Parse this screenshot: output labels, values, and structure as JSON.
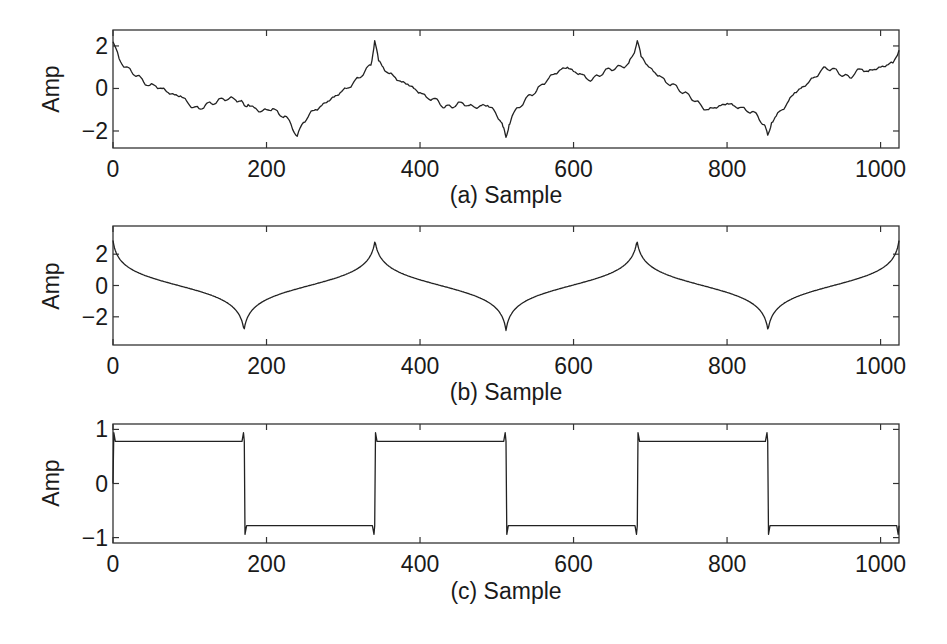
{
  "chart_data": [
    {
      "type": "line",
      "panel": "a",
      "title": "",
      "xlabel": "(a) Sample",
      "ylabel": "Amp",
      "xlim": [
        0,
        1024
      ],
      "ylim": [
        -2.8,
        2.75
      ],
      "xticks": [
        0,
        200,
        400,
        600,
        800,
        1000
      ],
      "yticks": [
        2,
        0,
        -2
      ],
      "ytick_labels": [
        "2",
        "0",
        "−2"
      ],
      "grid": false,
      "series": [
        {
          "name": "noisy signal",
          "x": [
            0,
            8,
            16,
            24,
            32,
            40,
            48,
            56,
            64,
            72,
            80,
            88,
            96,
            104,
            112,
            120,
            128,
            136,
            144,
            152,
            160,
            166,
            171,
            176,
            184,
            192,
            200,
            208,
            216,
            224,
            232,
            240,
            248,
            256,
            264,
            272,
            280,
            288,
            296,
            304,
            312,
            320,
            328,
            336,
            341,
            346,
            352,
            360,
            368,
            376,
            384,
            392,
            400,
            408,
            416,
            424,
            432,
            440,
            448,
            456,
            464,
            472,
            480,
            488,
            496,
            504,
            508,
            512,
            516,
            520,
            528,
            536,
            544,
            552,
            560,
            568,
            576,
            584,
            592,
            600,
            608,
            616,
            624,
            632,
            640,
            648,
            656,
            664,
            672,
            678,
            683,
            688,
            696,
            704,
            712,
            720,
            728,
            736,
            744,
            752,
            760,
            768,
            776,
            784,
            792,
            800,
            808,
            816,
            824,
            832,
            840,
            848,
            853,
            858,
            864,
            872,
            880,
            888,
            896,
            904,
            912,
            920,
            928,
            936,
            944,
            952,
            960,
            968,
            976,
            984,
            992,
            1000,
            1008,
            1016,
            1024
          ],
          "values": [
            2.2,
            1.4,
            1.0,
            0.8,
            0.6,
            0.3,
            0.15,
            0.1,
            0.0,
            -0.2,
            -0.3,
            -0.35,
            -0.6,
            -0.9,
            -0.95,
            -0.8,
            -0.7,
            -0.6,
            -0.5,
            -0.45,
            -0.55,
            -0.6,
            -0.8,
            -0.75,
            -0.9,
            -1.1,
            -1.0,
            -0.95,
            -1.2,
            -1.3,
            -1.7,
            -2.25,
            -1.6,
            -1.2,
            -1.0,
            -0.8,
            -0.6,
            -0.4,
            -0.2,
            0.0,
            0.2,
            0.5,
            0.8,
            1.1,
            2.25,
            1.3,
            1.0,
            0.7,
            0.5,
            0.3,
            0.2,
            0.0,
            -0.2,
            -0.4,
            -0.5,
            -0.6,
            -0.9,
            -0.85,
            -0.75,
            -0.7,
            -0.8,
            -0.9,
            -0.8,
            -0.8,
            -1.0,
            -1.5,
            -1.8,
            -2.3,
            -1.7,
            -1.3,
            -0.9,
            -0.6,
            -0.3,
            -0.1,
            0.2,
            0.5,
            0.7,
            0.9,
            1.0,
            0.8,
            0.7,
            0.5,
            0.4,
            0.6,
            0.8,
            0.9,
            1.0,
            1.0,
            1.2,
            1.6,
            2.25,
            1.5,
            1.1,
            0.8,
            0.6,
            0.3,
            0.2,
            0.0,
            -0.2,
            -0.4,
            -0.6,
            -0.9,
            -1.0,
            -0.9,
            -0.8,
            -0.7,
            -0.8,
            -0.9,
            -1.0,
            -1.1,
            -1.3,
            -1.7,
            -2.2,
            -1.6,
            -1.3,
            -1.0,
            -0.6,
            -0.2,
            0.0,
            0.2,
            0.5,
            0.7,
            1.0,
            0.9,
            0.8,
            0.6,
            0.5,
            0.8,
            0.9,
            0.8,
            0.9,
            1.0,
            1.1,
            1.2,
            1.8
          ]
        }
      ]
    },
    {
      "type": "line",
      "panel": "b",
      "title": "",
      "xlabel": "(b) Sample",
      "ylabel": "Amp",
      "xlim": [
        0,
        1024
      ],
      "ylim": [
        -3.8,
        3.8
      ],
      "xticks": [
        0,
        200,
        400,
        600,
        800,
        1000
      ],
      "yticks": [
        2,
        0,
        -2
      ],
      "ytick_labels": [
        "2",
        "0",
        "−2"
      ],
      "grid": false,
      "series": [
        {
          "name": "smooth cusp signal",
          "period": 341.33,
          "peak_value": 3.2,
          "trough_value": -3.2,
          "peaks_at": [
            0,
            341,
            683,
            1024
          ],
          "troughs_at": [
            171,
            512,
            853
          ]
        }
      ]
    },
    {
      "type": "line",
      "panel": "c",
      "title": "",
      "xlabel": "(c) Sample",
      "ylabel": "Amp",
      "xlim": [
        0,
        1024
      ],
      "ylim": [
        -1.1,
        1.1
      ],
      "xticks": [
        0,
        200,
        400,
        600,
        800,
        1000
      ],
      "yticks": [
        1,
        0,
        -1
      ],
      "ytick_labels": [
        "1",
        "0",
        "−1"
      ],
      "grid": false,
      "series": [
        {
          "name": "square wave",
          "levels": [
            0.78,
            -0.78
          ],
          "transitions_at": [
            0,
            171,
            341,
            512,
            683,
            853,
            1024
          ],
          "segment_values": [
            0.78,
            -0.78,
            0.78,
            -0.78,
            0.78,
            -0.78
          ]
        }
      ]
    }
  ],
  "panels": [
    {
      "xlabel": "(a) Sample",
      "ylabel": "Amp"
    },
    {
      "xlabel": "(b) Sample",
      "ylabel": "Amp"
    },
    {
      "xlabel": "(c) Sample",
      "ylabel": "Amp"
    }
  ]
}
